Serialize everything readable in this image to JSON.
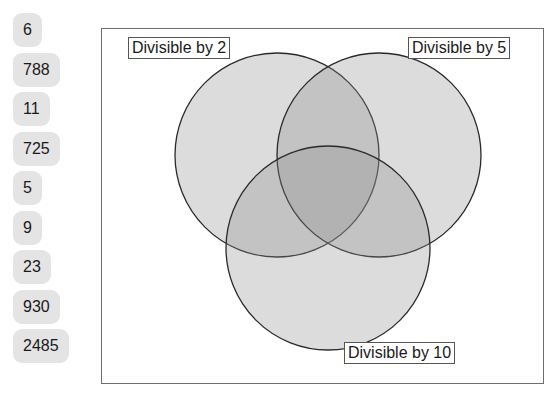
{
  "items": [
    {
      "label": "6",
      "top": 0
    },
    {
      "label": "788",
      "top": 40
    },
    {
      "label": "11",
      "top": 79
    },
    {
      "label": "725",
      "top": 119
    },
    {
      "label": "5",
      "top": 158
    },
    {
      "label": "9",
      "top": 198
    },
    {
      "label": "23",
      "top": 237
    },
    {
      "label": "930",
      "top": 277
    },
    {
      "label": "2485",
      "top": 316
    }
  ],
  "venn": {
    "sets": [
      {
        "label": "Divisible by 2",
        "cx": 277,
        "cy": 155,
        "r": 102
      },
      {
        "label": "Divisible by 5",
        "cx": 379,
        "cy": 155,
        "r": 102
      },
      {
        "label": "Divisible by 10",
        "cx": 328,
        "cy": 248,
        "r": 102
      }
    ],
    "colors": {
      "fill": "#8c8c8c",
      "fill_opacity": 0.3,
      "stroke": "#2a2a2a",
      "pill_bg": "#e4e4e4",
      "frame": "#6e6e6e"
    }
  }
}
